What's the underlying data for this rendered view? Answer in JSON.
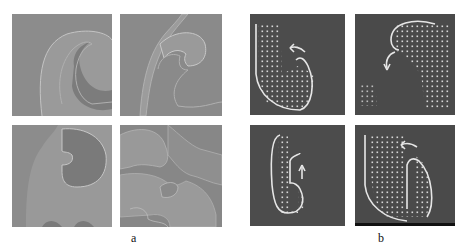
{
  "figure": {
    "panel_group_a": {
      "label": "a",
      "description": "Four grayscale simulation snapshots showing curling spiral-wave fronts",
      "tiles": [
        {
          "position": "top-left",
          "background": "#8a8a8a"
        },
        {
          "position": "top-right",
          "background": "#8a8a8a"
        },
        {
          "position": "bottom-left",
          "background": "#8a8a8a"
        },
        {
          "position": "bottom-right",
          "background": "#8a8a8a"
        }
      ]
    },
    "panel_group_b": {
      "label": "b",
      "description": "Four dark snapshots with dot-grid regions, white traced fronts and rotation arrows",
      "tiles": [
        {
          "position": "top-left",
          "background": "#4a4a4a"
        },
        {
          "position": "top-right",
          "background": "#4a4a4a"
        },
        {
          "position": "bottom-left",
          "background": "#4a4a4a"
        },
        {
          "position": "bottom-right",
          "background": "#4a4a4a"
        }
      ]
    }
  }
}
